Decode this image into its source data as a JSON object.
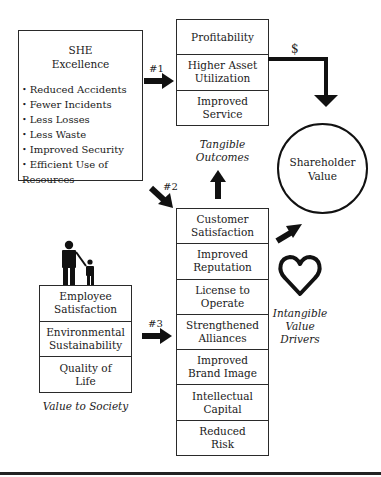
{
  "she_box": {
    "title": "SHE\nExcellence",
    "items": [
      "Reduced Accidents",
      "Fewer Incidents",
      "Less Losses",
      "Less Waste",
      "Improved Security",
      "Efficient Use of Resources"
    ]
  },
  "tangible": {
    "rows": [
      "Profitability",
      "Higher Asset\nUtilization",
      "Improved\nService"
    ],
    "caption": "Tangible\nOutcomes"
  },
  "intangible": {
    "rows": [
      "Customer\nSatisfaction",
      "Improved\nReputation",
      "License to\nOperate",
      "Strengthened\nAlliances",
      "Improved\nBrand Image",
      "Intellectual\nCapital",
      "Reduced\nRisk"
    ],
    "caption": "Intangible\nValue\nDrivers"
  },
  "society": {
    "rows": [
      "Employee\nSatisfaction",
      "Environmental\nSustainability",
      "Quality of\nLife"
    ],
    "caption": "Value to Society"
  },
  "shareholder": {
    "label": "Shareholder\nValue"
  },
  "arrows": {
    "path1": "#1",
    "path2": "#2",
    "path3": "#3",
    "dollar": "$"
  },
  "icons": {
    "people": "adult-and-child-icon",
    "heart": "heart-outline-icon"
  },
  "colors": {
    "stroke": "#111111",
    "background": "#ffffff"
  }
}
